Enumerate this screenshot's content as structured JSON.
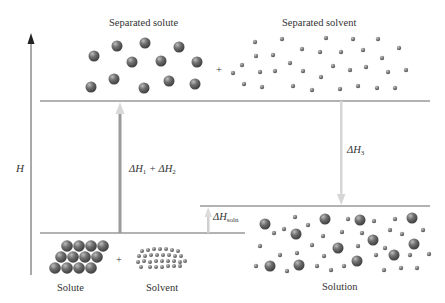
{
  "diagram": {
    "axis_label": "H",
    "labels": {
      "separated_solute": "Separated solute",
      "separated_solvent": "Separated solvent",
      "solute": "Solute",
      "solvent": "Solvent",
      "solution": "Solution",
      "plus_top": "+",
      "plus_bottom": "+"
    },
    "arrows": {
      "dh12": {
        "delta": "ΔH",
        "sub1": "1",
        "plus": " + ΔH",
        "sub2": "2"
      },
      "dh3": {
        "delta": "ΔH",
        "sub": "3"
      },
      "dhsoln": {
        "delta": "ΔH",
        "sub": "soln"
      }
    },
    "colors": {
      "line": "#555555",
      "arrow_up": "#9a9a9a",
      "arrow_light": "#cfcfcf",
      "sphere": "#6b6b6b",
      "text": "#333333"
    },
    "levels": {
      "separated": {
        "y": 101,
        "x1": 40,
        "x2": 430
      },
      "solution": {
        "y": 206,
        "x1": 200,
        "x2": 430
      },
      "initial": {
        "y": 233,
        "x1": 40,
        "x2": 245
      }
    }
  }
}
